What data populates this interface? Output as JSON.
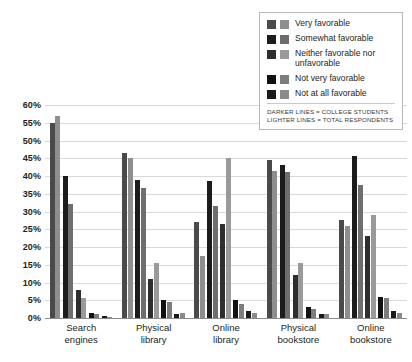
{
  "chart_data": {
    "type": "bar",
    "title": "",
    "xlabel": "",
    "ylabel": "",
    "ylim": [
      0,
      60
    ],
    "ytick_step": 5,
    "grid": true,
    "legend_position": "top-right",
    "categories": [
      "Search engines",
      "Physical library",
      "Online library",
      "Physical bookstore",
      "Online bookstore"
    ],
    "category_lines": [
      [
        "Search",
        "engines"
      ],
      [
        "Physical",
        "library"
      ],
      [
        "Online",
        "library"
      ],
      [
        "Physical",
        "bookstore"
      ],
      [
        "Online",
        "bookstore"
      ]
    ],
    "ytick_labels": [
      "60%",
      "55%",
      "50%",
      "45%",
      "40%",
      "35%",
      "30%",
      "25%",
      "20%",
      "15%",
      "10%",
      "5%",
      "0%"
    ],
    "ytick_values": [
      60,
      55,
      50,
      45,
      40,
      35,
      30,
      25,
      20,
      15,
      10,
      5,
      0
    ],
    "audiences": [
      {
        "key": "college",
        "name": "College students",
        "shade": "darker"
      },
      {
        "key": "total",
        "name": "Total respondents",
        "shade": "lighter"
      }
    ],
    "series": [
      {
        "name": "Very favorable",
        "color_dark": "#4a4a4a",
        "color_light": "#8e8e8e",
        "college": [
          55,
          46.5,
          27,
          44.5,
          27.5
        ],
        "total": [
          57,
          45,
          17.5,
          41.5,
          26
        ]
      },
      {
        "name": "Somewhat favorable",
        "color_dark": "#1c1c1c",
        "color_light": "#6e6e6e",
        "college": [
          40,
          39,
          38.5,
          43,
          45.5
        ],
        "total": [
          32,
          36.5,
          31.5,
          41,
          37.5
        ]
      },
      {
        "name": "Neither favorable nor unfavorable",
        "color_dark": "#2e2e2e",
        "color_light": "#9a9a9a",
        "college": [
          8,
          11,
          26.5,
          12,
          23
        ],
        "total": [
          5.5,
          15.5,
          45,
          15.5,
          29
        ]
      },
      {
        "name": "Not very favorable",
        "color_dark": "#111111",
        "color_light": "#7d7d7d",
        "college": [
          1.5,
          5,
          5,
          3,
          6
        ],
        "total": [
          1,
          4.5,
          4,
          2.5,
          5.5
        ]
      },
      {
        "name": "Not at all favorable",
        "color_dark": "#1a1a1a",
        "color_light": "#8a8a8a",
        "college": [
          0.6,
          1,
          2,
          1,
          2
        ],
        "total": [
          0.4,
          1.5,
          1.5,
          1,
          1.5
        ]
      }
    ]
  },
  "legend": {
    "entries": [
      {
        "label": "Very favorable"
      },
      {
        "label": "Somewhat favorable"
      },
      {
        "label": "Neither favorable nor unfavorable"
      },
      {
        "label": "Not very favorable"
      },
      {
        "label": "Not at all favorable"
      }
    ],
    "note_line_1": "DARKER LINES = COLLEGE STUDENTS",
    "note_line_2": "LIGHTER LINES = TOTAL RESPONDENTS"
  }
}
